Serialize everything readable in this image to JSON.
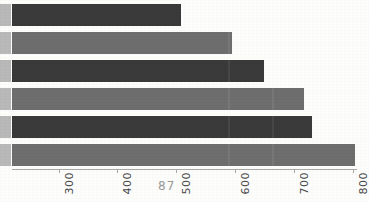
{
  "page": {
    "page_number": "87",
    "background_color": "#fdfdfc"
  },
  "colors": {
    "bar_dark": "#3a3a3a",
    "bar_light": "#6e6e6e",
    "axis": "#a8a8a8",
    "tick_label": "#4a4a4a",
    "gutter": "#b9b9b9",
    "page_number": "#9a9a9a"
  },
  "chart_data": {
    "type": "bar",
    "orientation": "horizontal",
    "title": "",
    "subtitle": "",
    "xlabel": "",
    "ylabel": "",
    "grid": false,
    "legend": "none",
    "xlim": [
      210,
      815
    ],
    "categories": [
      "1",
      "2",
      "3",
      "4",
      "5",
      "6"
    ],
    "values": [
      508,
      595,
      650,
      718,
      731,
      804
    ],
    "bar_colors": [
      "#3a3a3a",
      "#6e6e6e",
      "#3a3a3a",
      "#6e6e6e",
      "#3a3a3a",
      "#6e6e6e"
    ],
    "axis": {
      "tick_values": [
        300,
        400,
        500,
        600,
        700,
        800
      ],
      "tick_labels": [
        "300",
        "400",
        "500",
        "600",
        "700",
        "800"
      ],
      "tick_label_rotation": -90
    }
  }
}
